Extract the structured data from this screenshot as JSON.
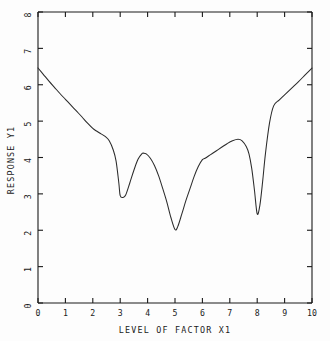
{
  "chart_data": {
    "type": "line",
    "title": "",
    "xlabel": "LEVEL OF FACTOR X1",
    "ylabel": "RESPONSE Y1",
    "xlim": [
      0,
      10
    ],
    "ylim": [
      0,
      8
    ],
    "grid": false,
    "legend": null,
    "xticks": [
      0,
      1,
      2,
      3,
      4,
      5,
      6,
      7,
      8,
      9,
      10
    ],
    "xtick_labels": [
      "0",
      "1",
      "2",
      "3",
      "4",
      "5",
      "6",
      "7",
      "8",
      "9",
      "10"
    ],
    "yticks": [
      0,
      1,
      2,
      3,
      4,
      5,
      6,
      7,
      8
    ],
    "ytick_labels": [
      "0",
      "1",
      "2",
      "3",
      "4",
      "5",
      "6",
      "7",
      "8"
    ],
    "series": [
      {
        "name": "Response Y1",
        "color": "#2b2b2b",
        "x": [
          0.0,
          0.2,
          0.4,
          0.6,
          0.8,
          1.0,
          1.2,
          1.4,
          1.6,
          1.8,
          2.0,
          2.15,
          2.3,
          2.45,
          2.6,
          2.75,
          2.85,
          2.95,
          3.0,
          3.1,
          3.2,
          3.35,
          3.5,
          3.65,
          3.8,
          3.85,
          3.95,
          4.1,
          4.25,
          4.4,
          4.55,
          4.7,
          4.85,
          5.0,
          5.1,
          5.25,
          5.4,
          5.55,
          5.7,
          5.85,
          6.0,
          6.1,
          6.3,
          6.5,
          6.7,
          6.9,
          7.1,
          7.3,
          7.45,
          7.6,
          7.7,
          7.8,
          7.9,
          8.0,
          8.1,
          8.2,
          8.3,
          8.45,
          8.6,
          8.8,
          9.0,
          9.25,
          9.5,
          9.75,
          10.0
        ],
        "y": [
          6.46,
          6.28,
          6.1,
          5.93,
          5.76,
          5.6,
          5.44,
          5.28,
          5.12,
          4.95,
          4.8,
          4.72,
          4.65,
          4.58,
          4.46,
          4.2,
          3.9,
          3.3,
          2.95,
          2.9,
          2.97,
          3.3,
          3.65,
          3.95,
          4.11,
          4.12,
          4.1,
          3.98,
          3.78,
          3.5,
          3.15,
          2.78,
          2.35,
          2.02,
          2.1,
          2.45,
          2.82,
          3.15,
          3.48,
          3.75,
          3.94,
          3.98,
          4.08,
          4.18,
          4.28,
          4.38,
          4.46,
          4.5,
          4.46,
          4.3,
          4.1,
          3.7,
          3.1,
          2.45,
          2.7,
          3.35,
          4.1,
          4.95,
          5.42,
          5.58,
          5.72,
          5.9,
          6.08,
          6.27,
          6.46
        ]
      }
    ]
  },
  "axes": {
    "x_title": "LEVEL OF FACTOR X1",
    "y_title": "RESPONSE Y1"
  },
  "frame": {
    "left_px": 38,
    "right_px": 312,
    "top_px": 12,
    "bottom_px": 303
  }
}
